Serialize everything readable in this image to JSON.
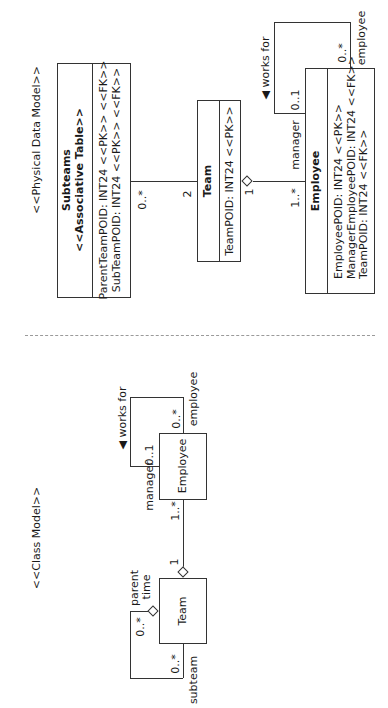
{
  "physical_model": {
    "title": "<<Physical Data Model>>",
    "subteams": {
      "name": "Subteams",
      "stereotype": "<<Associative Table>>",
      "attributes": [
        "ParentTeamPOID: INT24 <<PK>> <<FK>>",
        "SubTeamPOID: INT24 <<PK>> <<FK>>"
      ]
    },
    "team": {
      "name": "Team",
      "attributes": [
        "TeamPOID: INT24 <<PK>>"
      ]
    },
    "employee": {
      "name": "Employee",
      "attributes": [
        "EmployeePOID: INT24 <<PK>>",
        "ManagerEmployeePOID: INT24 <<FK>>",
        "TeamPOID: INT24 <<FK>>"
      ]
    },
    "assoc_subteams_team": {
      "subteams_mult": "0..*",
      "team_mult": "2"
    },
    "assoc_team_employee": {
      "team_mult": "1",
      "employee_mult": "1..*",
      "role": "manager"
    },
    "self_assoc": {
      "name": "works for",
      "arrow": "◀",
      "manager_mult": "0..1",
      "employee_mult": "0..*",
      "employee_role": "employee"
    }
  },
  "class_model": {
    "title": "<<Class Model>>",
    "employee": {
      "name": "Employee"
    },
    "team": {
      "name": "Team"
    },
    "self_assoc_employee": {
      "name": "works for",
      "arrow": "◀",
      "manager_role": "manager",
      "manager_mult": "0..1",
      "employee_mult": "0..*",
      "employee_role": "employee"
    },
    "assoc_team_employee": {
      "team_mult": "1",
      "employee_mult": "1..*"
    },
    "self_assoc_team": {
      "parent_role_line1": "parent",
      "parent_role_line2": "time",
      "parent_mult": "0..*",
      "subteam_mult": "0..*",
      "subteam_role": "subteam"
    }
  },
  "separator": {
    "style": "dashed"
  }
}
